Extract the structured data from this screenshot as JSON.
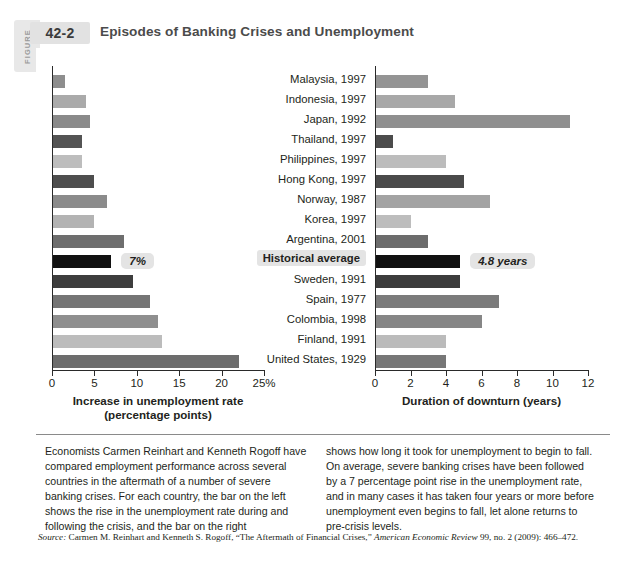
{
  "figure": {
    "word": "FIGURE",
    "number": "42-2",
    "title": "Episodes of Banking Crises and Unemployment"
  },
  "chart_data": {
    "type": "bar",
    "title": "Episodes of Banking Crises and Unemployment",
    "orientation": "horizontal",
    "grid": false,
    "legend": "none",
    "categories": [
      "Malaysia, 1997",
      "Indonesia, 1997",
      "Japan, 1992",
      "Thailand, 1997",
      "Philippines, 1997",
      "Hong Kong, 1997",
      "Norway, 1987",
      "Korea, 1997",
      "Argentina, 2001",
      "Historical average",
      "Sweden, 1991",
      "Spain, 1977",
      "Colombia, 1998",
      "Finland, 1991",
      "United States, 1929"
    ],
    "panels": [
      {
        "name": "left",
        "xlabel": "Increase in unemployment rate",
        "xlabel_line2": "(percentage points)",
        "xlim": [
          0,
          25
        ],
        "xticks": [
          0,
          5,
          10,
          15,
          20,
          25
        ],
        "xticklabels": [
          "0",
          "5",
          "10",
          "15",
          "20",
          "25%"
        ],
        "values": [
          1.5,
          4.0,
          4.5,
          3.5,
          3.5,
          5.0,
          6.5,
          5.0,
          8.5,
          7.0,
          9.5,
          11.5,
          12.5,
          13.0,
          22.0
        ],
        "annotation": "7%",
        "annotation_index": 9
      },
      {
        "name": "right",
        "xlabel": "Duration of downturn (years)",
        "xlabel_line2": "",
        "xlim": [
          0,
          12
        ],
        "xticks": [
          0,
          2,
          4,
          6,
          8,
          10,
          12
        ],
        "xticklabels": [
          "0",
          "2",
          "4",
          "6",
          "8",
          "10",
          "12"
        ],
        "values": [
          3.0,
          4.5,
          11.0,
          1.0,
          4.0,
          5.0,
          6.5,
          2.0,
          3.0,
          4.8,
          4.8,
          7.0,
          6.0,
          4.0,
          4.0
        ],
        "annotation": "4.8 years",
        "annotation_index": 9
      }
    ],
    "bar_colors_left": [
      "#8e8e8e",
      "#aaaaaa",
      "#8a8a8a",
      "#545454",
      "#bdbdbd",
      "#4e4e4e",
      "#8b8b8b",
      "#b3b3b3",
      "#6e6e6e",
      "#111111",
      "#3d3d3d",
      "#757575",
      "#8f8f8f",
      "#bcbcbc",
      "#6d6d6d"
    ],
    "bar_colors_right": [
      "#949494",
      "#a8a8a8",
      "#8f8f8f",
      "#4c4c4c",
      "#bcbcbc",
      "#4a4a4a",
      "#a3a3a3",
      "#bdbdbd",
      "#6c6c6c",
      "#111111",
      "#3c3c3c",
      "#7b7b7b",
      "#868686",
      "#bbbbbb",
      "#777777"
    ]
  },
  "body": {
    "left_column": "Economists Carmen Reinhart and Kenneth Rogoff have compared employment performance across several countries in the aftermath of a number of severe banking crises. For each country, the bar on the left shows the rise in the unemployment rate during and following the crisis, and the bar on the right",
    "right_column": "shows how long it took for unemployment to begin to fall. On average, severe banking crises have been followed by a 7 percentage point rise in the unemployment rate, and in many cases it has taken four years or more before unemployment even begins to fall, let alone returns to pre-crisis levels."
  },
  "source": {
    "label": "Source:",
    "text": " Carmen M. Reinhart and Kenneth S. Rogoff, “The Aftermath of Financial Crises,” ",
    "journal": "American Economic Review",
    "citation": " 99, no. 2 (2009): 466–472."
  }
}
